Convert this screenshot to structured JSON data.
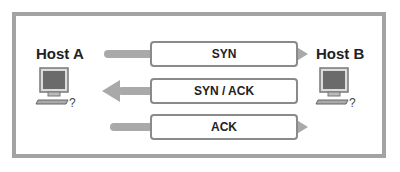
{
  "diagram": {
    "hosts": [
      {
        "label": "Host A",
        "icon": "computer-icon"
      },
      {
        "label": "Host B",
        "icon": "computer-icon"
      }
    ],
    "messages": [
      {
        "label": "SYN",
        "direction": "A->B"
      },
      {
        "label": "SYN / ACK",
        "direction": "B->A"
      },
      {
        "label": "ACK",
        "direction": "A->B"
      }
    ],
    "colors": {
      "border": "#a3a3a3",
      "arrow": "#a9a9a9",
      "box_border": "#8a8a8a",
      "screen": "#6b6b6b"
    }
  }
}
